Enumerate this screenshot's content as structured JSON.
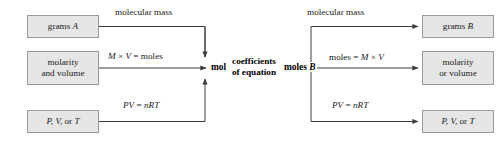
{
  "diagram": {
    "colors": {
      "box_fill": "#e6e6e6",
      "box_border": "#9a9a9a",
      "line": "#3c3c3c",
      "text": "#1a1a1a"
    },
    "left_boxes": [
      {
        "line1": "grams",
        "italic1": "A"
      },
      {
        "line1": "molarity",
        "line2": "and volume"
      },
      {
        "line1": "P, V,",
        "line2_inline": " or ",
        "line3_inline": "T"
      }
    ],
    "right_boxes": [
      {
        "line1": "grams",
        "italic1": "B"
      },
      {
        "line1": "molarity",
        "line2": "or volume"
      },
      {
        "line1": "P, V,",
        "line2_inline": " or ",
        "line3_inline": "T"
      }
    ],
    "nodes": {
      "moles_a_text": "moles",
      "moles_a_italic": "A",
      "moles_b_text": "moles",
      "moles_b_italic": "B"
    },
    "edge_labels": {
      "molecular_mass_left": "molecular mass",
      "molecular_mass_right": "molecular mass",
      "m_times_v_left": {
        "m": "M",
        "op": " × ",
        "v": "V",
        "eq": " = ",
        "result": "moles"
      },
      "moles_eq_mv_right": {
        "result": "moles",
        "eq": " = ",
        "m": "M",
        "op": " × ",
        "v": "V"
      },
      "pv_nrt_left": {
        "pv": "PV",
        "eq": " = ",
        "nrt": "nRT"
      },
      "pv_nrt_right": {
        "pv": "PV",
        "eq": " = ",
        "nrt": "nRT"
      },
      "coefficients_line1": "coefficients",
      "coefficients_line2": "of equation"
    }
  }
}
